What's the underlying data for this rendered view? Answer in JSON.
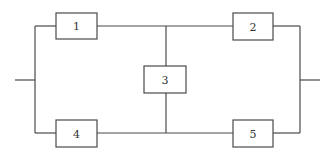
{
  "diagram": {
    "type": "bridge-network",
    "components": [
      {
        "id": "1",
        "label": "1"
      },
      {
        "id": "2",
        "label": "2"
      },
      {
        "id": "3",
        "label": "3"
      },
      {
        "id": "4",
        "label": "4"
      },
      {
        "id": "5",
        "label": "5"
      }
    ],
    "connections": [
      [
        "input",
        "1"
      ],
      [
        "input",
        "4"
      ],
      [
        "1",
        "2"
      ],
      [
        "4",
        "5"
      ],
      [
        "1-2 junction",
        "3"
      ],
      [
        "3",
        "4-5 junction"
      ],
      [
        "2",
        "output"
      ],
      [
        "5",
        "output"
      ]
    ],
    "colors": {
      "line": "#4a4a4a",
      "text": "#333333",
      "background": "#ffffff"
    }
  }
}
